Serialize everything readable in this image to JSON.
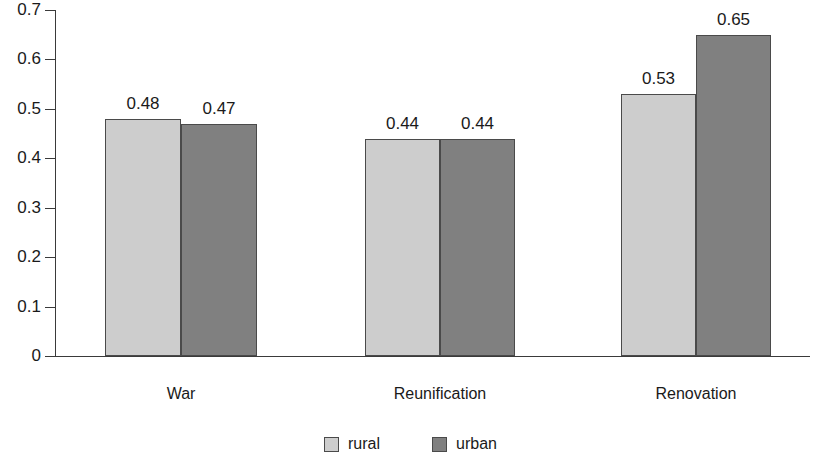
{
  "chart_data": {
    "type": "bar",
    "title": "",
    "subtitle": "",
    "xlabel": "",
    "ylabel": "",
    "categories": [
      "War",
      "Reunification",
      "Renovation"
    ],
    "series": [
      {
        "name": "rural",
        "color": "#cdcdcd",
        "values": [
          0.48,
          0.44,
          0.53
        ],
        "labels": [
          "0.48",
          "0.44",
          "0.53"
        ]
      },
      {
        "name": "urban",
        "color": "#808080",
        "values": [
          0.47,
          0.44,
          0.65
        ],
        "labels": [
          "0.47",
          "0.44",
          "0.65"
        ]
      }
    ],
    "ylim": [
      0,
      0.7
    ],
    "ytick_values": [
      0,
      0.1,
      0.2,
      0.3,
      0.4,
      0.5,
      0.6,
      0.7
    ],
    "ytick_labels": [
      "0",
      "0.1",
      "0.2",
      "0.3",
      "0.4",
      "0.5",
      "0.6",
      "0.7"
    ],
    "grid": false,
    "legend_position": "bottom",
    "legend_entries": [
      "rural",
      "urban"
    ],
    "annotations": [
      "data value labels shown above each bar"
    ],
    "axis_color": "#3a3a3a",
    "bar_border_color": "#4a4a4a"
  }
}
